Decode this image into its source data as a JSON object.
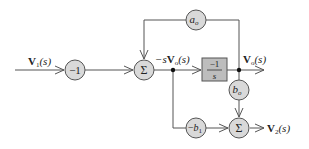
{
  "diagram": {
    "type": "signal-flow block diagram",
    "colors": {
      "line": "#555555",
      "node_fill": "#d9d9d9",
      "node_stroke": "#555555",
      "block_fill": "#bdbdbd",
      "text": "#222222"
    },
    "signals": {
      "input": {
        "base": "V",
        "sub": "1",
        "arg": "(s)"
      },
      "internal": {
        "prefix": "−s",
        "base": "V",
        "sub": "o",
        "arg": "(s)"
      },
      "output_o": {
        "base": "V",
        "sub": "o",
        "arg": "(s)"
      },
      "output_2": {
        "base": "V",
        "sub": "2",
        "arg": "(s)"
      }
    },
    "nodes": {
      "gain_neg1": {
        "label": "−1"
      },
      "sum1": {
        "label": "Σ"
      },
      "feedback_ao": {
        "base": "a",
        "sub": "o"
      },
      "integrator": {
        "numerator": "−1",
        "denominator": "s"
      },
      "gain_bo": {
        "base": "b",
        "sub": "o"
      },
      "gain_neg_b1": {
        "prefix": "−",
        "base": "b",
        "sub": "1"
      },
      "sum2": {
        "label": "Σ"
      }
    }
  }
}
